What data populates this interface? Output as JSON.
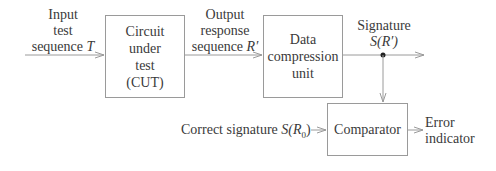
{
  "diagram": {
    "blocks": {
      "cut": {
        "lines": [
          "Circuit",
          "under",
          "test",
          "(CUT)"
        ]
      },
      "dcu": {
        "lines": [
          "Data",
          "compression",
          "unit"
        ]
      },
      "comparator": {
        "label": "Comparator"
      }
    },
    "labels": {
      "input": {
        "line1": "Input",
        "line2": "test",
        "line3_text": "sequence ",
        "line3_var": "T"
      },
      "output": {
        "line1": "Output",
        "line2": "response",
        "line3_text": "sequence ",
        "line3_var": "R′"
      },
      "signature": {
        "line1": "Signature",
        "line2": "S(R′)"
      },
      "correct": {
        "text": "Correct signature ",
        "var": "S(R",
        "sub": "0",
        "close": ")"
      },
      "error": {
        "line1": "Error",
        "line2": "indicator"
      }
    },
    "colors": {
      "line": "#9a9a9a",
      "text": "#3a3a3a",
      "dot": "#222222"
    }
  }
}
